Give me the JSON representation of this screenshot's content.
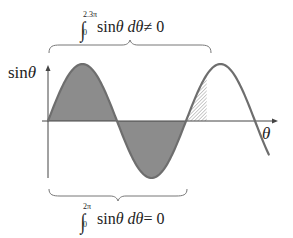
{
  "diagram": {
    "title": "",
    "axes": {
      "y_label": "sinθ",
      "y_label_func": "sin",
      "y_label_var": "θ",
      "x_label": "θ"
    },
    "top_annotation": {
      "integral_symbol": "∫",
      "lower_limit": "0",
      "upper_limit": "2.3π",
      "expression": "sinθ dθ ≠ 0",
      "expr_func": "sin",
      "expr_var": "θ",
      "expr_diff": "dθ",
      "expr_rel": "≠ 0",
      "brace_span": "0 to 2.3π"
    },
    "bottom_annotation": {
      "integral_symbol": "∫",
      "lower_limit": "0",
      "upper_limit": "2π",
      "expression": "sinθ dθ = 0",
      "expr_func": "sin",
      "expr_var": "θ",
      "expr_diff": "dθ",
      "expr_rel": "= 0",
      "brace_span": "0 to 2π"
    },
    "curve": {
      "function": "sin(θ)",
      "domain_start": "0",
      "domain_end": "approx 3.2π",
      "shaded_solid": "0 to 2π",
      "shaded_hatched": "2π to 2.3π"
    },
    "colors": {
      "curve_stroke": "#6e6e6e",
      "solid_fill": "#8c8c8c",
      "hatch": "#a8a8a8",
      "axis": "#444444",
      "brace": "#777777",
      "text": "#222222"
    }
  }
}
